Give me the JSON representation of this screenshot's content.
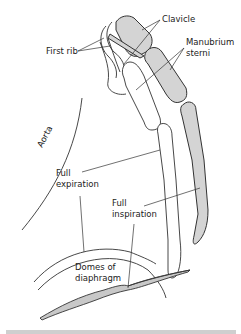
{
  "figure": {
    "labels": {
      "clavicle": "Clavicle",
      "first_rib": "First rib",
      "manubrium_line1": "Manubrium",
      "manubrium_line2": "sterni",
      "aorta": "Aorta",
      "full_expiration_line1": "Full",
      "full_expiration_line2": "expiration",
      "full_inspiration_line1": "Full",
      "full_inspiration_line2": "inspiration",
      "domes_line1": "Domes of",
      "domes_line2": "diaphragm"
    },
    "colors": {
      "bone_shaded": "#d4d4d4",
      "outline": "#333333",
      "background": "#ffffff"
    }
  }
}
